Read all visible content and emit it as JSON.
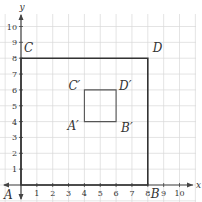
{
  "diagram": {
    "type": "coordinate-grid-dilation",
    "axes": {
      "x_label": "x",
      "y_label": "y",
      "x_ticks": [
        "1",
        "2",
        "3",
        "4",
        "5",
        "6",
        "7",
        "8",
        "9",
        "10"
      ],
      "y_ticks": [
        "1",
        "2",
        "3",
        "4",
        "5",
        "6",
        "7",
        "8",
        "9",
        "10"
      ],
      "range": [
        0,
        10
      ]
    },
    "large_square": {
      "vertices": [
        {
          "label": "A",
          "x": 0,
          "y": 0
        },
        {
          "label": "B",
          "x": 8,
          "y": 0
        },
        {
          "label": "D",
          "x": 8,
          "y": 8
        },
        {
          "label": "C",
          "x": 0,
          "y": 8
        }
      ]
    },
    "small_square": {
      "vertices": [
        {
          "label": "A′",
          "x": 4,
          "y": 4
        },
        {
          "label": "B′",
          "x": 6,
          "y": 4
        },
        {
          "label": "D′",
          "x": 6,
          "y": 6
        },
        {
          "label": "C′",
          "x": 4,
          "y": 6
        }
      ]
    },
    "colors": {
      "grid": "#d9d9d9",
      "axis": "#444444",
      "shape": "#333333",
      "small_shape": "#555555"
    }
  }
}
